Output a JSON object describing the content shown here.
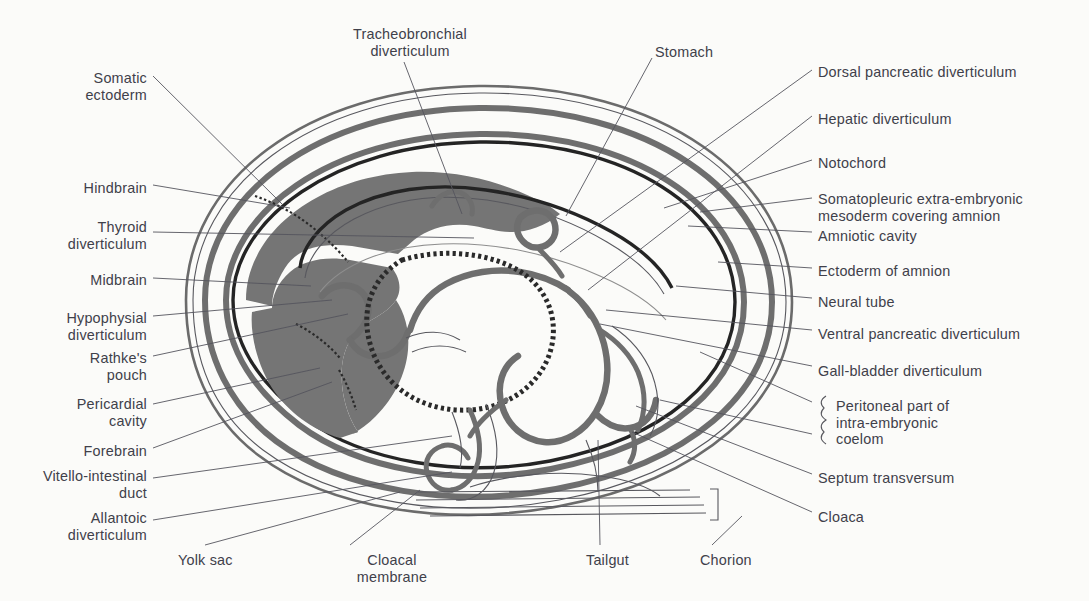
{
  "figure": {
    "background_color": "#fbfbf9",
    "ink_color": "#40404a",
    "mesoderm_fill": "#757575",
    "leader_line_color": "#55555e",
    "outline_dark": "#1d1d1d",
    "outline_mid": "#6e6e6e"
  },
  "labels": {
    "top": [
      {
        "id": "tracheobronchial-diverticulum",
        "text": "Tracheobronchial\ndiverticulum",
        "x": 335,
        "y": 26,
        "align": "center",
        "width": 150
      },
      {
        "id": "stomach",
        "text": "Stomach",
        "x": 655,
        "y": 44,
        "align": "left",
        "width": 80
      }
    ],
    "left": [
      {
        "id": "somatic-ectoderm",
        "text": "Somatic\nectoderm",
        "x": 52,
        "y": 70,
        "align": "right",
        "width": 95
      },
      {
        "id": "hindbrain",
        "text": "Hindbrain",
        "x": 62,
        "y": 180,
        "align": "right",
        "width": 85
      },
      {
        "id": "thyroid-diverticulum",
        "text": "Thyroid\ndiverticulum",
        "x": 40,
        "y": 219,
        "align": "right",
        "width": 107
      },
      {
        "id": "midbrain",
        "text": "Midbrain",
        "x": 70,
        "y": 272,
        "align": "right",
        "width": 77
      },
      {
        "id": "hypophysial-diverticulum",
        "text": "Hypophysial\ndiverticulum",
        "x": 40,
        "y": 310,
        "align": "right",
        "width": 107
      },
      {
        "id": "rathkes-pouch",
        "text": "Rathke's\npouch",
        "x": 70,
        "y": 350,
        "align": "right",
        "width": 77
      },
      {
        "id": "pericardial-cavity",
        "text": "Pericardial\ncavity",
        "x": 50,
        "y": 396,
        "align": "right",
        "width": 97
      },
      {
        "id": "forebrain",
        "text": "Forebrain",
        "x": 65,
        "y": 443,
        "align": "right",
        "width": 82
      },
      {
        "id": "vitello-intestinal-duct",
        "text": "Vitello-intestinal\nduct",
        "x": 14,
        "y": 468,
        "align": "right",
        "width": 133
      },
      {
        "id": "allantoic-diverticulum",
        "text": "Allantoic\ndiverticulum",
        "x": 40,
        "y": 510,
        "align": "right",
        "width": 107
      }
    ],
    "right": [
      {
        "id": "dorsal-pancreatic-diverticulum",
        "text": "Dorsal pancreatic diverticulum",
        "x": 818,
        "y": 64
      },
      {
        "id": "hepatic-diverticulum",
        "text": "Hepatic diverticulum",
        "x": 818,
        "y": 111
      },
      {
        "id": "notochord",
        "text": "Notochord",
        "x": 818,
        "y": 155
      },
      {
        "id": "somatopleuric-mesoderm",
        "text": "Somatopleuric extra-embryonic\nmesoderm covering amnion",
        "x": 818,
        "y": 191
      },
      {
        "id": "amniotic-cavity",
        "text": "Amniotic cavity",
        "x": 818,
        "y": 228
      },
      {
        "id": "ectoderm-of-amnion",
        "text": "Ectoderm of amnion",
        "x": 818,
        "y": 263
      },
      {
        "id": "neural-tube",
        "text": "Neural tube",
        "x": 818,
        "y": 294
      },
      {
        "id": "ventral-pancreatic-diverticulum",
        "text": "Ventral pancreatic diverticulum",
        "x": 818,
        "y": 326
      },
      {
        "id": "gall-bladder-diverticulum",
        "text": "Gall-bladder diverticulum",
        "x": 818,
        "y": 363
      },
      {
        "id": "peritoneal-part-coelom",
        "text": "Peritoneal part of\nintra-embryonic\ncoelom",
        "x": 836,
        "y": 398
      },
      {
        "id": "septum-transversum",
        "text": "Septum transversum",
        "x": 818,
        "y": 470
      },
      {
        "id": "cloaca",
        "text": "Cloaca",
        "x": 818,
        "y": 509
      }
    ],
    "bottom": [
      {
        "id": "yolk-sac",
        "text": "Yolk sac",
        "x": 178,
        "y": 552,
        "align": "left"
      },
      {
        "id": "cloacal-membrane",
        "text": "Cloacal\nmembrane",
        "x": 337,
        "y": 552,
        "align": "center",
        "width": 110
      },
      {
        "id": "tailgut",
        "text": "Tailgut",
        "x": 586,
        "y": 552,
        "align": "left"
      },
      {
        "id": "chorion",
        "text": "Chorion",
        "x": 700,
        "y": 552,
        "align": "left"
      }
    ]
  },
  "structures": [
    {
      "id": "chorion-outer-wall",
      "name": "chorion"
    },
    {
      "id": "extra-embryonic-coelom",
      "name": "extra-embryonic coelom"
    },
    {
      "id": "amnion-wall",
      "name": "amnion"
    },
    {
      "id": "amniotic-cavity-space",
      "name": "amniotic cavity"
    },
    {
      "id": "embryo-body",
      "name": "embryo body"
    },
    {
      "id": "neural-tube-path",
      "name": "neural tube"
    },
    {
      "id": "brain-vesicles",
      "name": "fore-, mid- and hindbrain"
    },
    {
      "id": "foregut",
      "name": "foregut"
    },
    {
      "id": "midgut-yolk-sac",
      "name": "midgut and yolk sac"
    },
    {
      "id": "hindgut-tailgut",
      "name": "hindgut and tailgut"
    },
    {
      "id": "allantois",
      "name": "allantoic diverticulum"
    },
    {
      "id": "vitelline-duct",
      "name": "vitello-intestinal duct"
    },
    {
      "id": "pericardial-cavity-space",
      "name": "pericardial cavity"
    },
    {
      "id": "septum-transversum-mass",
      "name": "septum transversum"
    }
  ],
  "footer_ghost": "· · · · · · · · · · · · · · · ·"
}
